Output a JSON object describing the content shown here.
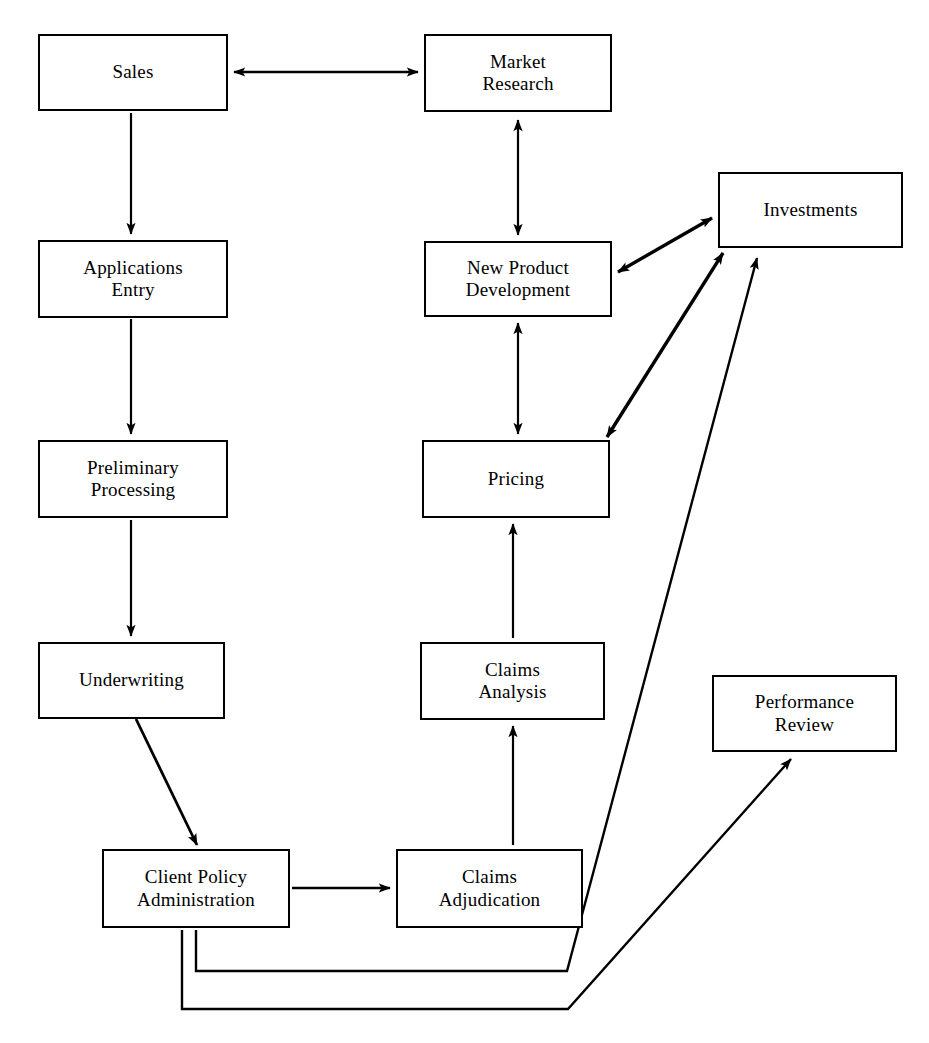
{
  "diagram": {
    "type": "flowchart",
    "background_color": "#ffffff",
    "line_color": "#000000",
    "box_border_color": "#000000",
    "box_fill_color": "#ffffff",
    "nodes": [
      {
        "id": "sales",
        "label": "Sales",
        "x": 38,
        "y": 34,
        "w": 190,
        "h": 77
      },
      {
        "id": "market-research",
        "label": "Market\nResearch",
        "x": 424,
        "y": 34,
        "w": 188,
        "h": 78
      },
      {
        "id": "investments",
        "label": "Investments",
        "x": 718,
        "y": 172,
        "w": 185,
        "h": 76
      },
      {
        "id": "applications-entry",
        "label": "Applications\nEntry",
        "x": 38,
        "y": 240,
        "w": 190,
        "h": 78
      },
      {
        "id": "new-product-development",
        "label": "New Product\nDevelopment",
        "x": 424,
        "y": 241,
        "w": 188,
        "h": 76
      },
      {
        "id": "preliminary-processing",
        "label": "Preliminary\nProcessing",
        "x": 38,
        "y": 440,
        "w": 190,
        "h": 78
      },
      {
        "id": "pricing",
        "label": "Pricing",
        "x": 422,
        "y": 440,
        "w": 188,
        "h": 78
      },
      {
        "id": "underwriting",
        "label": "Underwriting",
        "x": 38,
        "y": 642,
        "w": 187,
        "h": 77
      },
      {
        "id": "claims-analysis",
        "label": "Claims\nAnalysis",
        "x": 420,
        "y": 642,
        "w": 185,
        "h": 78
      },
      {
        "id": "performance-review",
        "label": "Performance\nReview",
        "x": 712,
        "y": 675,
        "w": 185,
        "h": 77
      },
      {
        "id": "client-policy-administration",
        "label": "Client Policy\nAdministration",
        "x": 102,
        "y": 849,
        "w": 188,
        "h": 79
      },
      {
        "id": "claims-adjudication",
        "label": "Claims\nAdjudication",
        "x": 396,
        "y": 849,
        "w": 187,
        "h": 79
      }
    ],
    "edges": [
      {
        "id": "sales-market-research",
        "from": "sales",
        "to": "market-research",
        "direction": "both"
      },
      {
        "id": "sales-applications-entry",
        "from": "sales",
        "to": "applications-entry",
        "direction": "forward"
      },
      {
        "id": "market-research-new-product",
        "from": "market-research",
        "to": "new-product-development",
        "direction": "both"
      },
      {
        "id": "applications-preliminary",
        "from": "applications-entry",
        "to": "preliminary-processing",
        "direction": "forward"
      },
      {
        "id": "preliminary-underwriting",
        "from": "preliminary-processing",
        "to": "underwriting",
        "direction": "forward"
      },
      {
        "id": "new-product-investments",
        "from": "new-product-development",
        "to": "investments",
        "direction": "both"
      },
      {
        "id": "new-product-pricing",
        "from": "new-product-development",
        "to": "pricing",
        "direction": "both"
      },
      {
        "id": "pricing-investments",
        "from": "pricing",
        "to": "investments",
        "direction": "both"
      },
      {
        "id": "claims-analysis-pricing",
        "from": "claims-analysis",
        "to": "pricing",
        "direction": "forward"
      },
      {
        "id": "underwriting-client-policy",
        "from": "underwriting",
        "to": "client-policy-administration",
        "direction": "forward"
      },
      {
        "id": "client-policy-claims-adjudication",
        "from": "client-policy-administration",
        "to": "claims-adjudication",
        "direction": "forward"
      },
      {
        "id": "claims-adjudication-claims-analysis",
        "from": "claims-adjudication",
        "to": "claims-analysis",
        "direction": "forward"
      },
      {
        "id": "client-policy-investments",
        "from": "client-policy-administration",
        "to": "investments",
        "direction": "forward"
      },
      {
        "id": "client-policy-performance-review",
        "from": "client-policy-administration",
        "to": "performance-review",
        "direction": "forward"
      }
    ]
  }
}
